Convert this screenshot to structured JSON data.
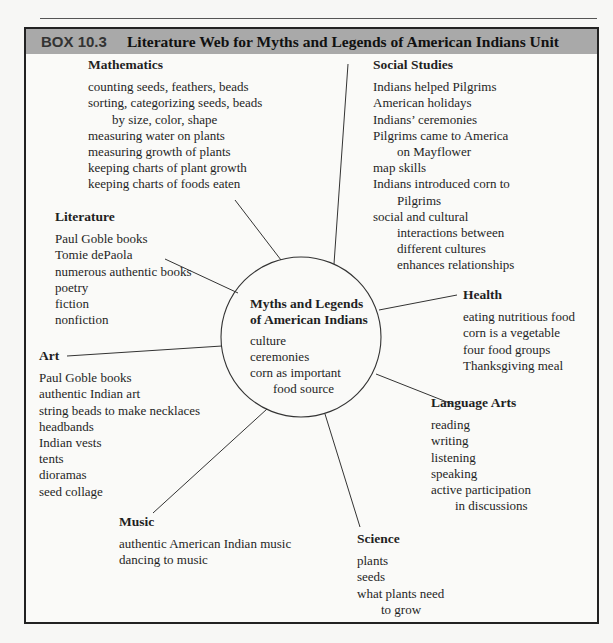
{
  "box": {
    "label": "BOX 10.3",
    "title": "Literature Web for Myths and Legends of American Indians Unit"
  },
  "center": {
    "heading_lines": [
      "Myths and Legends",
      "of American Indians"
    ],
    "items": [
      {
        "text": "culture",
        "indent": false
      },
      {
        "text": "ceremonies",
        "indent": false
      },
      {
        "text": "corn as important",
        "indent": false
      },
      {
        "text": "food source",
        "indent": true
      }
    ]
  },
  "nodes": {
    "mathematics": {
      "heading": "Mathematics",
      "items": [
        {
          "text": "counting seeds, feathers, beads",
          "indent": false
        },
        {
          "text": "sorting, categorizing seeds, beads",
          "indent": false
        },
        {
          "text": "by size, color, shape",
          "indent": true
        },
        {
          "text": "measuring water on plants",
          "indent": false
        },
        {
          "text": "measuring growth of plants",
          "indent": false
        },
        {
          "text": "keeping charts of plant growth",
          "indent": false
        },
        {
          "text": "keeping charts of foods eaten",
          "indent": false
        }
      ]
    },
    "social_studies": {
      "heading": "Social Studies",
      "items": [
        {
          "text": "Indians helped Pilgrims",
          "indent": false
        },
        {
          "text": "American holidays",
          "indent": false
        },
        {
          "text": "Indians’ ceremonies",
          "indent": false
        },
        {
          "text": "Pilgrims came to  America",
          "indent": false
        },
        {
          "text": "on Mayflower",
          "indent": true
        },
        {
          "text": "map skills",
          "indent": false
        },
        {
          "text": "Indians introduced  corn to",
          "indent": false
        },
        {
          "text": "Pilgrims",
          "indent": true
        },
        {
          "text": "social and cultural",
          "indent": false
        },
        {
          "text": "interactions between",
          "indent": true
        },
        {
          "text": "different cultures",
          "indent": true
        },
        {
          "text": "enhances relationships",
          "indent": true
        }
      ]
    },
    "literature": {
      "heading": "Literature",
      "items": [
        {
          "text": "Paul Goble books",
          "indent": false
        },
        {
          "text": "Tomie dePaola",
          "indent": false
        },
        {
          "text": "numerous authentic books",
          "indent": false
        },
        {
          "text": "poetry",
          "indent": false
        },
        {
          "text": "fiction",
          "indent": false
        },
        {
          "text": "nonfiction",
          "indent": false
        }
      ]
    },
    "health": {
      "heading": "Health",
      "items": [
        {
          "text": "eating nutritious  food",
          "indent": false
        },
        {
          "text": "corn is a vegetable",
          "indent": false
        },
        {
          "text": "four food groups",
          "indent": false
        },
        {
          "text": "Thanksgiving meal",
          "indent": false
        }
      ]
    },
    "art": {
      "heading": "Art",
      "items": [
        {
          "text": "Paul Goble books",
          "indent": false
        },
        {
          "text": "authentic Indian art",
          "indent": false
        },
        {
          "text": "string beads to make necklaces",
          "indent": false
        },
        {
          "text": "headbands",
          "indent": false
        },
        {
          "text": "Indian vests",
          "indent": false
        },
        {
          "text": "tents",
          "indent": false
        },
        {
          "text": "dioramas",
          "indent": false
        },
        {
          "text": "seed collage",
          "indent": false
        }
      ]
    },
    "language_arts": {
      "heading": "Language Arts",
      "items": [
        {
          "text": "reading",
          "indent": false
        },
        {
          "text": "writing",
          "indent": false
        },
        {
          "text": "listening",
          "indent": false
        },
        {
          "text": "speaking",
          "indent": false
        },
        {
          "text": "active participation",
          "indent": false
        },
        {
          "text": "in discussions",
          "indent": true
        }
      ]
    },
    "music": {
      "heading": "Music",
      "items": [
        {
          "text": "authentic American Indian music",
          "indent": false
        },
        {
          "text": "dancing to music",
          "indent": false
        }
      ]
    },
    "science": {
      "heading": "Science",
      "items": [
        {
          "text": "plants",
          "indent": false
        },
        {
          "text": "seeds",
          "indent": false
        },
        {
          "text": "what plants need",
          "indent": false
        },
        {
          "text": "to grow",
          "indent": true
        }
      ]
    }
  }
}
